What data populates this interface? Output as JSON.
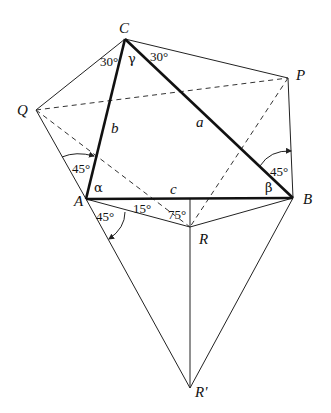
{
  "points": {
    "A": {
      "label": "A",
      "x": 86,
      "y": 199
    },
    "B": {
      "label": "B",
      "x": 293,
      "y": 198
    },
    "C": {
      "label": "C",
      "x": 125,
      "y": 39
    },
    "P": {
      "label": "P",
      "x": 288,
      "y": 78
    },
    "Q": {
      "label": "Q",
      "x": 36,
      "y": 110
    },
    "R": {
      "label": "R",
      "x": 190,
      "y": 227
    },
    "Rp": {
      "label": "R'",
      "x": 190,
      "y": 388
    }
  },
  "sides": {
    "a": "a",
    "b": "b",
    "c": "c"
  },
  "angles": {
    "alpha": "α",
    "beta": "β",
    "gamma": "γ",
    "C_left": "30°",
    "C_right": "30°",
    "A_upper": "45°",
    "A_lower": "45°",
    "B_upper": "45°",
    "A_R": "15°",
    "R_A": "75°"
  }
}
